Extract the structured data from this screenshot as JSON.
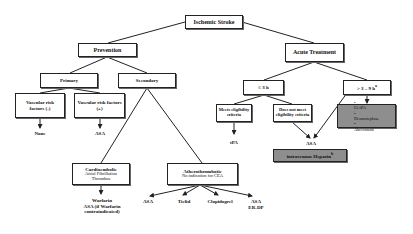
{
  "diagram": {
    "root": {
      "label": "Ischemic Stroke"
    },
    "prevention": {
      "label": "Prevention",
      "primary": {
        "label": "Primary",
        "vascular_neg": {
          "label": "Vascular risk factors (-)",
          "outcome": "None"
        },
        "vascular_pos": {
          "label": "Vascular risk factors (+)",
          "outcome": "ASA"
        }
      },
      "secondary": {
        "label": "Secondary",
        "cardioembolic": {
          "title": "Cardioembolic",
          "sub1": "Atrial Fibrillation",
          "sub2": "Thrombus",
          "outcome_line1": "Warfarin",
          "outcome_line2": "ASA (if Warfarin",
          "outcome_line3": "contraindicated)"
        },
        "atherothrombotic": {
          "title": "Atherothrombotic",
          "sub1": "No indication for CEA",
          "outcomes": [
            "ASA",
            "Ticlid",
            "Clopidogrel",
            "ASA",
            "ER-DP"
          ]
        }
      }
    },
    "acute": {
      "label": "Acute Treatment",
      "le3h": {
        "label": "≤ 3 h",
        "meets": {
          "label": "Meets eligibility criteria",
          "outcome": "tPA"
        },
        "not_meets": {
          "label": "Does not meet eligibility criteria"
        }
      },
      "gt3h": {
        "label": "> 3 – 9 h",
        "marker": "a",
        "options": [
          "IA tPA",
          "Desmoteplase",
          "Abciximab"
        ]
      },
      "asa_outcome": "ASA",
      "heparin": {
        "label": "intravenous Heparin",
        "marker": "b"
      }
    }
  }
}
